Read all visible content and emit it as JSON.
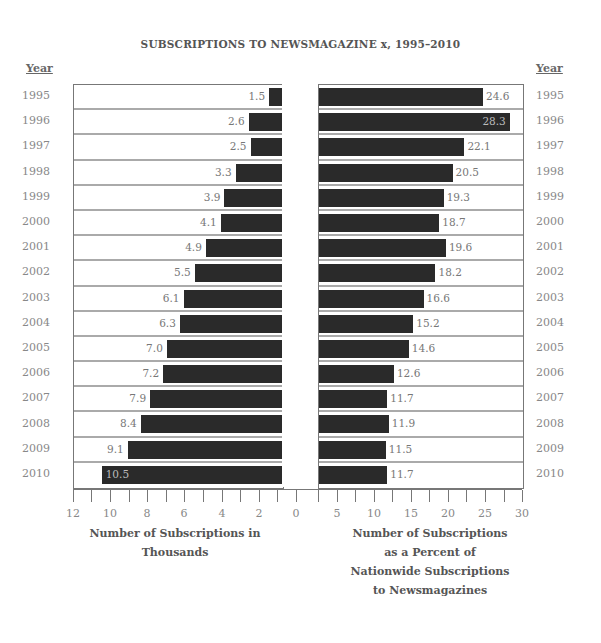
{
  "chart_data": {
    "type": "bar",
    "title": "SUBSCRIPTIONS TO NEWSMAGAZINE x, 1995–2010",
    "categories": [
      "1995",
      "1996",
      "1997",
      "1998",
      "1999",
      "2000",
      "2001",
      "2002",
      "2003",
      "2004",
      "2005",
      "2006",
      "2007",
      "2008",
      "2009",
      "2010"
    ],
    "year_header": "Year",
    "left": {
      "name": "Number of Subscriptions in Thousands",
      "xlabel_lines": [
        "Number of Subscriptions in",
        "Thousands"
      ],
      "values": [
        1.5,
        2.6,
        2.5,
        3.3,
        3.9,
        4.1,
        4.9,
        5.5,
        6.1,
        6.3,
        7.0,
        7.2,
        7.9,
        8.4,
        9.1,
        10.5
      ],
      "labels": [
        "1.5",
        "2.6",
        "2.5",
        "3.3",
        "3.9",
        "4.1",
        "4.9",
        "5.5",
        "6.1",
        "6.3",
        "7.0",
        "7.2",
        "7.9",
        "8.4",
        "9.1",
        "10.5"
      ],
      "ticks": [
        "12",
        "10",
        "8",
        "6",
        "4",
        "2",
        "0"
      ],
      "xlim": [
        12,
        0
      ]
    },
    "right": {
      "name": "Number of Subscriptions as a Percent of Nationwide Subscriptions to Newsmagazines",
      "xlabel_lines": [
        "Number of Subscriptions",
        "as a Percent of",
        "Nationwide Subscriptions",
        "to Newsmagazines"
      ],
      "values": [
        24.6,
        28.3,
        22.1,
        20.5,
        19.3,
        18.7,
        19.6,
        18.2,
        16.6,
        15.2,
        14.6,
        12.6,
        11.7,
        11.9,
        11.5,
        11.7
      ],
      "labels": [
        "24.6",
        "28.3",
        "22.1",
        "20.5",
        "19.3",
        "18.7",
        "19.6",
        "18.2",
        "16.6",
        "15.2",
        "14.6",
        "12.6",
        "11.7",
        "11.9",
        "11.5",
        "11.7"
      ],
      "ticks": [
        "5",
        "10",
        "15",
        "20",
        "25",
        "30"
      ],
      "xlim": [
        2.5,
        30
      ]
    }
  },
  "colors": {
    "bar": "#2a2a2a",
    "text": "#555555",
    "grid": "#aaaaaa"
  }
}
